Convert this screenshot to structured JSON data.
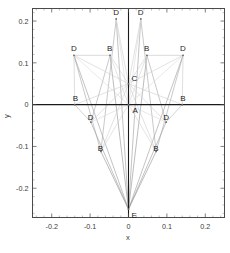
{
  "chart_data": {
    "type": "scatter",
    "title": "",
    "xlabel": "x",
    "ylabel": "y",
    "xlim": [
      -0.25,
      0.25
    ],
    "ylim": [
      -0.27,
      0.23
    ],
    "grid": false,
    "legend": null,
    "x_ticks": [
      -0.2,
      -0.1,
      0,
      0.1,
      0.2
    ],
    "x_tick_labels": [
      "-0.2",
      "-0.1",
      "0",
      "0.1",
      "0.2"
    ],
    "y_ticks": [
      -0.2,
      -0.1,
      0,
      0.1,
      0.2
    ],
    "y_tick_labels": [
      "-0.2",
      "-0.1",
      "0",
      "0.1",
      "0.2"
    ],
    "x_minor_ticks": [
      -0.24,
      -0.22,
      -0.18,
      -0.16,
      -0.14,
      -0.12,
      -0.08,
      -0.06,
      -0.04,
      -0.02,
      0.02,
      0.04,
      0.06,
      0.08,
      0.12,
      0.14,
      0.16,
      0.18,
      0.22,
      0.24
    ],
    "y_minor_ticks": [
      -0.26,
      -0.24,
      -0.22,
      -0.18,
      -0.16,
      -0.14,
      -0.12,
      -0.08,
      -0.06,
      -0.04,
      -0.02,
      0.02,
      0.04,
      0.06,
      0.08,
      0.12,
      0.14,
      0.16,
      0.18,
      0.22
    ],
    "axis_lines": {
      "x_axis_at_y": 0,
      "y_axis_at_x": 0,
      "color": "#1a1a1a"
    },
    "nodes": [
      {
        "id": "A",
        "label": "A",
        "x": 0.0,
        "y": 0.0,
        "label_dx": 4,
        "label_dy": 8
      },
      {
        "id": "C",
        "label": "C",
        "x": 0.0,
        "y": 0.05,
        "label_dx": 3,
        "label_dy": -3
      },
      {
        "id": "E",
        "label": "E",
        "x": 0.0,
        "y": -0.25,
        "label_dx": 3,
        "label_dy": 9
      },
      {
        "id": "B1",
        "label": "B",
        "x": -0.14,
        "y": 0.0,
        "label_dx": -2,
        "label_dy": -4
      },
      {
        "id": "B2",
        "label": "B",
        "x": 0.14,
        "y": 0.0,
        "label_dx": -2,
        "label_dy": -4
      },
      {
        "id": "B3",
        "label": "B",
        "x": -0.048,
        "y": 0.118,
        "label_dx": -3,
        "label_dy": -4
      },
      {
        "id": "B4",
        "label": "B",
        "x": 0.048,
        "y": 0.118,
        "label_dx": -3,
        "label_dy": -4
      },
      {
        "id": "B5",
        "label": "B",
        "x": -0.072,
        "y": -0.112,
        "label_dx": -3,
        "label_dy": 0
      },
      {
        "id": "B6",
        "label": "B",
        "x": 0.072,
        "y": -0.112,
        "label_dx": -3,
        "label_dy": 0
      },
      {
        "id": "D1",
        "label": "D",
        "x": -0.032,
        "y": 0.205,
        "label_dx": -3,
        "label_dy": -4
      },
      {
        "id": "D2",
        "label": "D",
        "x": 0.032,
        "y": 0.205,
        "label_dx": -3,
        "label_dy": -4
      },
      {
        "id": "D3",
        "label": "D",
        "x": -0.142,
        "y": 0.118,
        "label_dx": -3,
        "label_dy": -4
      },
      {
        "id": "D4",
        "label": "D",
        "x": 0.142,
        "y": 0.118,
        "label_dx": -3,
        "label_dy": -4
      },
      {
        "id": "D5",
        "label": "D",
        "x": -0.098,
        "y": -0.042,
        "label_dx": -3,
        "label_dy": -2
      },
      {
        "id": "D6",
        "label": "D",
        "x": 0.098,
        "y": -0.042,
        "label_dx": -3,
        "label_dy": -2
      }
    ],
    "edges": [
      {
        "from": "E",
        "to": "D1",
        "color": "#9a9a9a",
        "width": 0.6
      },
      {
        "from": "E",
        "to": "D2",
        "color": "#9a9a9a",
        "width": 0.6
      },
      {
        "from": "E",
        "to": "D3",
        "color": "#9a9a9a",
        "width": 0.6
      },
      {
        "from": "E",
        "to": "D4",
        "color": "#9a9a9a",
        "width": 0.6
      },
      {
        "from": "E",
        "to": "D5",
        "color": "#9a9a9a",
        "width": 0.6
      },
      {
        "from": "E",
        "to": "D6",
        "color": "#9a9a9a",
        "width": 0.6
      },
      {
        "from": "E",
        "to": "B3",
        "color": "#8f8f8f",
        "width": 0.6
      },
      {
        "from": "E",
        "to": "B4",
        "color": "#8f8f8f",
        "width": 0.6
      },
      {
        "from": "E",
        "to": "B5",
        "color": "#8f8f8f",
        "width": 0.6
      },
      {
        "from": "E",
        "to": "B6",
        "color": "#8f8f8f",
        "width": 0.6
      },
      {
        "from": "E",
        "to": "C",
        "color": "#8f8f8f",
        "width": 0.6
      },
      {
        "from": "D1",
        "to": "B5",
        "color": "#a5a5a5",
        "width": 0.6
      },
      {
        "from": "D2",
        "to": "B6",
        "color": "#a5a5a5",
        "width": 0.6
      },
      {
        "from": "D3",
        "to": "B5",
        "color": "#a5a5a5",
        "width": 0.6
      },
      {
        "from": "D4",
        "to": "B6",
        "color": "#a5a5a5",
        "width": 0.6
      },
      {
        "from": "D5",
        "to": "B3",
        "color": "#a5a5a5",
        "width": 0.6
      },
      {
        "from": "D6",
        "to": "B4",
        "color": "#a5a5a5",
        "width": 0.6
      },
      {
        "from": "D1",
        "to": "C",
        "color": "#cfcfcf",
        "width": 0.6
      },
      {
        "from": "D2",
        "to": "C",
        "color": "#cfcfcf",
        "width": 0.6
      },
      {
        "from": "D3",
        "to": "C",
        "color": "#cfcfcf",
        "width": 0.6
      },
      {
        "from": "D4",
        "to": "C",
        "color": "#cfcfcf",
        "width": 0.6
      },
      {
        "from": "D5",
        "to": "C",
        "color": "#cfcfcf",
        "width": 0.6
      },
      {
        "from": "D6",
        "to": "C",
        "color": "#cfcfcf",
        "width": 0.6
      },
      {
        "from": "B1",
        "to": "C",
        "color": "#cfcfcf",
        "width": 0.6
      },
      {
        "from": "B2",
        "to": "C",
        "color": "#cfcfcf",
        "width": 0.6
      },
      {
        "from": "B3",
        "to": "C",
        "color": "#cfcfcf",
        "width": 0.6
      },
      {
        "from": "B4",
        "to": "C",
        "color": "#cfcfcf",
        "width": 0.6
      },
      {
        "from": "B5",
        "to": "C",
        "color": "#cfcfcf",
        "width": 0.6
      },
      {
        "from": "B6",
        "to": "C",
        "color": "#cfcfcf",
        "width": 0.6
      },
      {
        "from": "B1",
        "to": "A",
        "color": "#d2d2d2",
        "width": 0.6
      },
      {
        "from": "B2",
        "to": "A",
        "color": "#d2d2d2",
        "width": 0.6
      },
      {
        "from": "B3",
        "to": "A",
        "color": "#d2d2d2",
        "width": 0.6
      },
      {
        "from": "B4",
        "to": "A",
        "color": "#d2d2d2",
        "width": 0.6
      },
      {
        "from": "B5",
        "to": "A",
        "color": "#d2d2d2",
        "width": 0.6
      },
      {
        "from": "B6",
        "to": "A",
        "color": "#d2d2d2",
        "width": 0.6
      },
      {
        "from": "D1",
        "to": "A",
        "color": "#d8d8d8",
        "width": 0.6
      },
      {
        "from": "D2",
        "to": "A",
        "color": "#d8d8d8",
        "width": 0.6
      },
      {
        "from": "D3",
        "to": "A",
        "color": "#d8d8d8",
        "width": 0.6
      },
      {
        "from": "D4",
        "to": "A",
        "color": "#d8d8d8",
        "width": 0.6
      },
      {
        "from": "D5",
        "to": "A",
        "color": "#d8d8d8",
        "width": 0.6
      },
      {
        "from": "D6",
        "to": "A",
        "color": "#d8d8d8",
        "width": 0.6
      },
      {
        "from": "B1",
        "to": "D5",
        "color": "#b5b5b5",
        "width": 0.6
      },
      {
        "from": "B2",
        "to": "D6",
        "color": "#b5b5b5",
        "width": 0.6
      },
      {
        "from": "B1",
        "to": "D3",
        "color": "#c8c8c8",
        "width": 0.6
      },
      {
        "from": "B2",
        "to": "D4",
        "color": "#c8c8c8",
        "width": 0.6
      },
      {
        "from": "D3",
        "to": "B3",
        "color": "#c2c2c2",
        "width": 0.6
      },
      {
        "from": "D4",
        "to": "B4",
        "color": "#c2c2c2",
        "width": 0.6
      }
    ]
  },
  "plot": {
    "frame_color": "#4a4a4a",
    "background": "#ffffff"
  }
}
